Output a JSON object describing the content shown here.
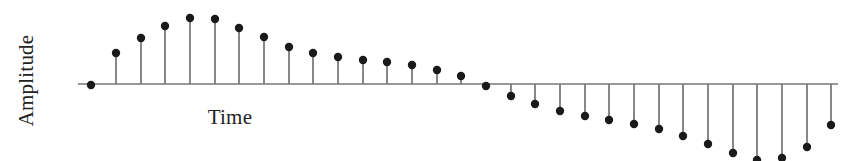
{
  "figure": {
    "width": 854,
    "height": 161,
    "background": "#ffffff"
  },
  "labels": {
    "ylabel": "Amplitude",
    "xlabel": "Time"
  },
  "style": {
    "marker_color": "#1a1a1a",
    "stem_color": "#555555",
    "axis_color": "#777777",
    "text_color": "#232323",
    "marker_radius": 4.2,
    "stem_width": 1.4,
    "axis_width": 1.3
  },
  "chart_data": {
    "type": "stem",
    "title": "",
    "xlabel": "Time",
    "ylabel": "Amplitude",
    "grid": false,
    "legend": false,
    "axis_visible": true,
    "tick_labels": [],
    "baseline_y_px": 84,
    "axis_x_start_px": 78,
    "axis_x_end_px": 838,
    "stem_spacing_px": 24.7,
    "first_stem_x_px": 91,
    "x": [
      0,
      1,
      2,
      3,
      4,
      5,
      6,
      7,
      8,
      9,
      10,
      11,
      12,
      13,
      14,
      15,
      16,
      17,
      18,
      19,
      20,
      21,
      22,
      23,
      24,
      25,
      26,
      27,
      28,
      29,
      30
    ],
    "values": [
      -0.02,
      0.47,
      0.69,
      0.86,
      0.97,
      0.96,
      0.83,
      0.69,
      0.55,
      0.46,
      0.4,
      0.36,
      0.33,
      0.28,
      0.22,
      0.13,
      -0.02,
      -0.16,
      -0.28,
      -0.38,
      -0.44,
      -0.5,
      -0.55,
      -0.62,
      -0.71,
      -0.83,
      -0.95,
      -1.05,
      -1.02,
      -0.86,
      -0.56
    ],
    "ylim": [
      -1.1,
      1.05
    ],
    "xlim": [
      -0.6,
      30.6
    ],
    "clipped_below_axis": true,
    "marker_points_px": [
      {
        "x": 91,
        "y": 85
      },
      {
        "x": 116,
        "y": 53
      },
      {
        "x": 141,
        "y": 38
      },
      {
        "x": 165,
        "y": 26
      },
      {
        "x": 190,
        "y": 18
      },
      {
        "x": 215,
        "y": 19
      },
      {
        "x": 239,
        "y": 28
      },
      {
        "x": 264,
        "y": 37
      },
      {
        "x": 289,
        "y": 47
      },
      {
        "x": 313,
        "y": 53
      },
      {
        "x": 338,
        "y": 57
      },
      {
        "x": 363,
        "y": 60
      },
      {
        "x": 387,
        "y": 62
      },
      {
        "x": 412,
        "y": 65
      },
      {
        "x": 437,
        "y": 70
      },
      {
        "x": 461,
        "y": 76
      },
      {
        "x": 486,
        "y": 86
      },
      {
        "x": 511,
        "y": 96
      },
      {
        "x": 535,
        "y": 104
      },
      {
        "x": 560,
        "y": 111
      },
      {
        "x": 585,
        "y": 116
      },
      {
        "x": 609,
        "y": 120
      },
      {
        "x": 634,
        "y": 124
      },
      {
        "x": 659,
        "y": 129
      },
      {
        "x": 683,
        "y": 136
      },
      {
        "x": 708,
        "y": 144
      },
      {
        "x": 733,
        "y": 153
      },
      {
        "x": 757,
        "y": 160
      },
      {
        "x": 782,
        "y": 158
      },
      {
        "x": 807,
        "y": 147
      },
      {
        "x": 831,
        "y": 125
      }
    ]
  }
}
